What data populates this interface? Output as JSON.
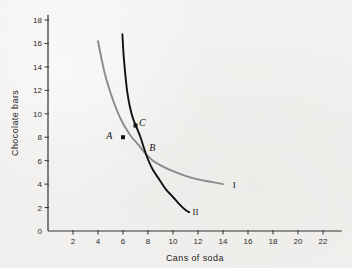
{
  "figure": {
    "background_color": "#f2f1ef",
    "type": "indifference-curve-graph"
  },
  "chart_data": {
    "type": "line",
    "title": "",
    "xlabel": "Cans of soda",
    "ylabel": "Chocolate bars",
    "xlim": [
      0,
      23.5
    ],
    "ylim": [
      0,
      19
    ],
    "xticks": [
      2,
      4,
      6,
      8,
      10,
      12,
      14,
      16,
      18,
      20,
      22
    ],
    "yticks": [
      0,
      2,
      4,
      6,
      8,
      10,
      12,
      14,
      16,
      18
    ],
    "xtick_labels": [
      "2",
      "4",
      "6",
      "8",
      "10",
      "12",
      "14",
      "16",
      "18",
      "20",
      "22"
    ],
    "ytick_labels": [
      "0",
      "2",
      "4",
      "6",
      "8",
      "10",
      "12",
      "14",
      "16",
      "18"
    ],
    "grid": false,
    "legend": "inline-curve-labels",
    "series": [
      {
        "name": "I",
        "label": "I",
        "color": "#8a8a8a",
        "label_position": [
          14.9,
          4.0
        ],
        "points": [
          [
            4.0,
            16.2
          ],
          [
            4.3,
            14.6
          ],
          [
            4.6,
            13.2
          ],
          [
            5.0,
            11.8
          ],
          [
            5.4,
            10.6
          ],
          [
            5.8,
            9.6
          ],
          [
            6.2,
            8.8
          ],
          [
            6.7,
            8.0
          ],
          [
            7.2,
            7.4
          ],
          [
            7.8,
            6.6
          ],
          [
            8.4,
            6.0
          ],
          [
            9.2,
            5.5
          ],
          [
            10.0,
            5.1
          ],
          [
            11.0,
            4.7
          ],
          [
            12.0,
            4.4
          ],
          [
            13.0,
            4.2
          ],
          [
            14.0,
            4.0
          ]
        ]
      },
      {
        "name": "II",
        "label": "II",
        "color": "#111111",
        "label_position": [
          11.8,
          1.7
        ],
        "points": [
          [
            5.95,
            16.8
          ],
          [
            6.05,
            15.0
          ],
          [
            6.2,
            13.2
          ],
          [
            6.35,
            11.8
          ],
          [
            6.55,
            10.6
          ],
          [
            6.8,
            9.6
          ],
          [
            7.1,
            8.8
          ],
          [
            7.4,
            8.0
          ],
          [
            7.7,
            7.0
          ],
          [
            8.0,
            6.1
          ],
          [
            8.4,
            5.2
          ],
          [
            8.9,
            4.4
          ],
          [
            9.4,
            3.6
          ],
          [
            10.0,
            2.9
          ],
          [
            10.5,
            2.3
          ],
          [
            11.0,
            1.8
          ],
          [
            11.3,
            1.6
          ]
        ]
      }
    ],
    "annotations": [
      {
        "label": "A",
        "x": 6.0,
        "y": 8.0,
        "marker": true,
        "label_offset": [
          -1.1,
          0.15
        ],
        "on_curve": "I"
      },
      {
        "label": "B",
        "x": 8.0,
        "y": 6.0,
        "marker": false,
        "label_offset": [
          0.35,
          1.1
        ],
        "on_curve": "I and II"
      },
      {
        "label": "C",
        "x": 7.0,
        "y": 9.0,
        "marker": true,
        "label_offset": [
          0.55,
          0.25
        ],
        "on_curve": "II"
      }
    ]
  }
}
